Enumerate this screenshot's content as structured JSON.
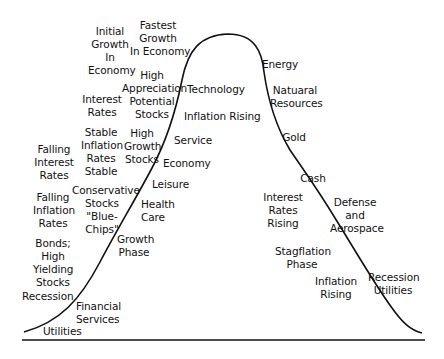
{
  "diagram": {
    "type": "business-cycle-bell-curve",
    "colors": {
      "line": "#111111",
      "background": "#ffffff",
      "text": "#111111"
    },
    "labels": [
      {
        "id": "initial-growth",
        "text": "Initial\nGrowth\nIn\nEconomy",
        "x": 88,
        "y": 25,
        "w": 44
      },
      {
        "id": "fastest-growth",
        "text": "Fastest\nGrowth\nIn Economy",
        "x": 130,
        "y": 19,
        "w": 56
      },
      {
        "id": "high-appreciation",
        "text": "High\nAppreciation\nPotential\nStocks",
        "x": 122,
        "y": 69,
        "w": 60
      },
      {
        "id": "interest-rates",
        "text": "Interest\nRates",
        "x": 82,
        "y": 93,
        "w": 40
      },
      {
        "id": "stable-inflation",
        "text": "Stable\nInflation\nRates\nStable",
        "x": 81,
        "y": 126,
        "w": 40
      },
      {
        "id": "high-growth-stocks",
        "text": "High\nGrowth\nStocks",
        "x": 124,
        "y": 127,
        "w": 36
      },
      {
        "id": "falling-interest",
        "text": "Falling\nInterest\nRates",
        "x": 34,
        "y": 143,
        "w": 40
      },
      {
        "id": "falling-inflation",
        "text": "Falling\nInflation\nRates",
        "x": 33,
        "y": 191,
        "w": 40
      },
      {
        "id": "conservative-stocks",
        "text": "Conservative\nStocks\n\"Blue-\nChips\"",
        "x": 72,
        "y": 184,
        "w": 60
      },
      {
        "id": "bonds",
        "text": "Bonds;\nHigh\nYielding\nStocks",
        "x": 33,
        "y": 237,
        "w": 40
      },
      {
        "id": "recession-left",
        "text": "Recession",
        "x": 22,
        "y": 290,
        "w": 46
      },
      {
        "id": "financial-services",
        "text": "Financial\nServices",
        "x": 76,
        "y": 300,
        "w": 40
      },
      {
        "id": "utilities-left",
        "text": "Utilities",
        "x": 43,
        "y": 325,
        "w": 36
      },
      {
        "id": "technology",
        "text": "Technology",
        "x": 187,
        "y": 83,
        "w": 55
      },
      {
        "id": "inflation-rising-top",
        "text": "Inflation Rising",
        "x": 184,
        "y": 110,
        "w": 72
      },
      {
        "id": "service",
        "text": "Service",
        "x": 174,
        "y": 134,
        "w": 34
      },
      {
        "id": "economy",
        "text": "Economy",
        "x": 163,
        "y": 157,
        "w": 44
      },
      {
        "id": "leisure",
        "text": "Leisure",
        "x": 152,
        "y": 178,
        "w": 36
      },
      {
        "id": "health-care",
        "text": "Health\nCare",
        "x": 141,
        "y": 198,
        "w": 32,
        "align": "left"
      },
      {
        "id": "growth-phase",
        "text": "Growth\nPhase",
        "x": 117,
        "y": 233,
        "w": 34
      },
      {
        "id": "energy",
        "text": "Energy",
        "x": 262,
        "y": 58,
        "w": 36
      },
      {
        "id": "natural-resources",
        "text": "Natuaral\nResources",
        "x": 270,
        "y": 84,
        "w": 50
      },
      {
        "id": "gold",
        "text": "Gold",
        "x": 281,
        "y": 131,
        "w": 26
      },
      {
        "id": "cash",
        "text": "Cash",
        "x": 300,
        "y": 172,
        "w": 26
      },
      {
        "id": "interest-rates-rising",
        "text": "Interest\nRates\nRising",
        "x": 263,
        "y": 191,
        "w": 40
      },
      {
        "id": "defense-aerospace",
        "text": "Defense\nand\nAerospace",
        "x": 330,
        "y": 196,
        "w": 50
      },
      {
        "id": "stagflation-phase",
        "text": "Stagflation\nPhase",
        "x": 275,
        "y": 245,
        "w": 54
      },
      {
        "id": "inflation-rising-bottom",
        "text": "Inflation\nRising",
        "x": 315,
        "y": 275,
        "w": 42
      },
      {
        "id": "recession-utilities",
        "text": "Recession\nUtilities",
        "x": 368,
        "y": 271,
        "w": 50
      }
    ],
    "curve_path": "M 24 332 C 60 322, 80 300, 100 262 C 118 228, 135 200, 152 168 C 168 138, 176 110, 182 80 C 188 50, 200 35, 228 34 C 255 34, 262 52, 264 72 C 268 100, 275 125, 290 150 C 305 172, 318 190, 335 218 C 355 250, 375 285, 392 308 C 402 322, 410 330, 422 333",
    "baseline": {
      "x1": 22,
      "x2": 425,
      "y": 340
    }
  }
}
